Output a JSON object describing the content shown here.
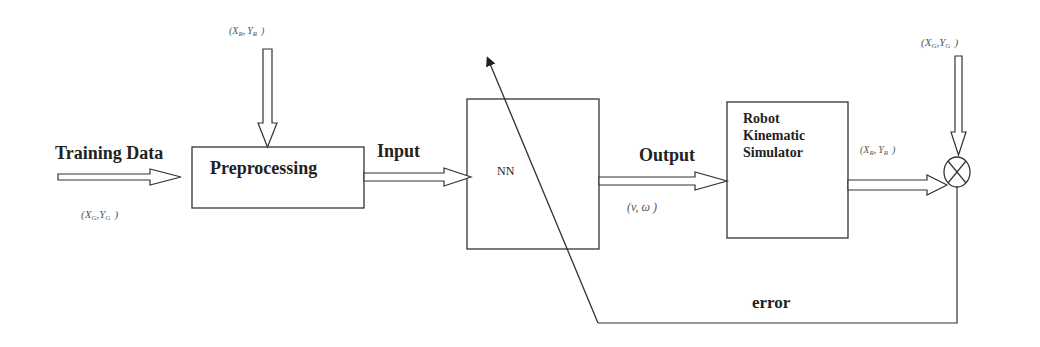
{
  "diagram": {
    "type": "block-diagram",
    "colors": {
      "line": "#333333",
      "text": "#222222",
      "math_text": "#555555",
      "background": "#ffffff"
    },
    "blocks": [
      {
        "id": "preprocessing",
        "label": "Preprocessing"
      },
      {
        "id": "nn",
        "label": "NN"
      },
      {
        "id": "robot",
        "label_lines": [
          "Robot",
          "Kinematic",
          "Simulator"
        ]
      }
    ],
    "junction": {
      "id": "summing-junction",
      "symbol": "⊗"
    },
    "labels": {
      "training_data": "Training Data",
      "input": "Input",
      "output": "Output",
      "error": "error"
    },
    "signals": {
      "goal_training": {
        "open": "(",
        "x": "X",
        "x_sub": "G",
        "sep": ",",
        "y": "Y",
        "y_sub": "G",
        "close": ")"
      },
      "robot_to_pre": {
        "open": "(",
        "x": "X",
        "x_sub": "R",
        "sep": ",",
        "y": "Y",
        "y_sub": "R",
        "close": ")"
      },
      "nn_output": {
        "text": "(v,   ω  )"
      },
      "robot_output": {
        "open": "(",
        "x": "X",
        "x_sub": "R",
        "sep": ",",
        "y": "Y",
        "y_sub": "R",
        "close": ")"
      },
      "goal_reference": {
        "open": "(",
        "x": "X",
        "x_sub": "G",
        "sep": ",",
        "y": "Y",
        "y_sub": "G",
        "close": ")"
      }
    },
    "connections": [
      {
        "from": "training_data",
        "to": "preprocessing",
        "style": "hollow-arrow"
      },
      {
        "from": "robot_to_pre",
        "to": "preprocessing",
        "style": "hollow-arrow"
      },
      {
        "from": "preprocessing",
        "to": "nn",
        "label": "Input",
        "style": "hollow-arrow"
      },
      {
        "from": "nn",
        "to": "robot",
        "label": "Output",
        "style": "hollow-arrow"
      },
      {
        "from": "robot",
        "to": "summing-junction",
        "style": "hollow-arrow"
      },
      {
        "from": "goal_reference",
        "to": "summing-junction",
        "style": "hollow-arrow"
      },
      {
        "from": "summing-junction",
        "to": "nn",
        "label": "error",
        "style": "feedback-line-diagonal-arrow"
      }
    ]
  }
}
